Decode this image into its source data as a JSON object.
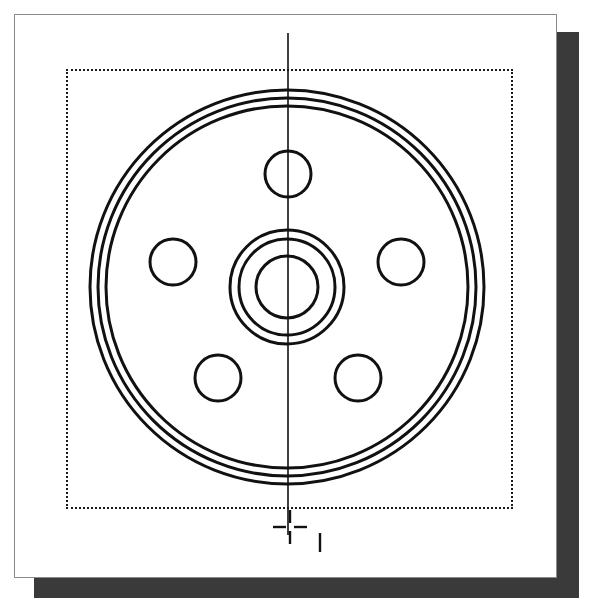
{
  "canvas": {
    "width": 595,
    "height": 604,
    "background": "#ffffff"
  },
  "paper": {
    "name": "drawing-sheet",
    "x": 14,
    "y": 14,
    "width": 543,
    "height": 564,
    "fill": "#ffffff",
    "border_color": "#8a8a8a"
  },
  "shadow": {
    "name": "paper-drop-shadow",
    "x": 34,
    "y": 32,
    "width": 545,
    "height": 566,
    "color": "#3a3a3a"
  },
  "selection_rect": {
    "name": "dotted-selection-rectangle",
    "x": 65,
    "y": 68,
    "width": 447,
    "height": 440,
    "style": "dotted",
    "color": "#1a1a1a",
    "thickness": 2
  },
  "drawing": {
    "title": "Wheel Hub Flange Front View",
    "stroke_color": "#111111",
    "center": {
      "x": 287,
      "y": 287
    },
    "rim_circles": [
      {
        "name": "rim-outer-circle",
        "radius": 197,
        "stroke_width": 3
      },
      {
        "name": "rim-middle-circle",
        "radius": 189,
        "stroke_width": 3
      },
      {
        "name": "rim-inner-circle",
        "radius": 181,
        "stroke_width": 3
      }
    ],
    "hub_circles": [
      {
        "name": "hub-outer-circle",
        "radius": 57,
        "stroke_width": 3
      },
      {
        "name": "hub-middle-circle",
        "radius": 48,
        "stroke_width": 3
      },
      {
        "name": "hub-bore-circle",
        "radius": 31,
        "stroke_width": 3
      }
    ],
    "bolt_holes": {
      "count": 5,
      "hole_radius": 23,
      "bolt_circle_radius": 113,
      "stroke_width": 3,
      "positions": [
        {
          "name": "bolt-hole-top",
          "cx": 288,
          "cy": 174
        },
        {
          "name": "bolt-hole-right",
          "cx": 401,
          "cy": 262
        },
        {
          "name": "bolt-hole-bottom-right",
          "cx": 358,
          "cy": 378
        },
        {
          "name": "bolt-hole-bottom-left",
          "cx": 218,
          "cy": 378
        },
        {
          "name": "bolt-hole-left",
          "cx": 173,
          "cy": 262
        }
      ]
    },
    "centerline": {
      "name": "vertical-centerline",
      "x": 288,
      "y1": 33,
      "y2": 535,
      "stroke_width": 1.6
    }
  },
  "cursor": {
    "name": "crosshair-cursor",
    "x": 290,
    "y": 527,
    "arm_length": 13,
    "gap": 4,
    "stroke_width": 2.4,
    "color": "#1a1a1a",
    "tick": {
      "name": "cursor-tick-mark",
      "x": 320,
      "y1": 533,
      "y2": 552,
      "stroke_width": 2.4
    }
  }
}
